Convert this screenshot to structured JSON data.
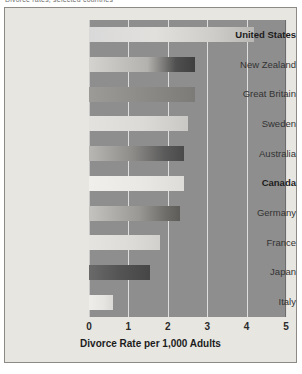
{
  "caption": {
    "clipped_text": "Divorce rates, selected countries"
  },
  "chart_data": {
    "type": "bar",
    "orientation": "horizontal",
    "title": "",
    "xlabel": "Divorce Rate per 1,000 Adults",
    "ylabel": "",
    "xlim": [
      0,
      5
    ],
    "xticks": [
      "0",
      "1",
      "2",
      "3",
      "4",
      "5"
    ],
    "grid": true,
    "legend": "none",
    "categories": [
      "United States",
      "New Zealand",
      "Great Britain",
      "Sweden",
      "Australia",
      "Canada",
      "Germany",
      "France",
      "Japan",
      "Italy"
    ],
    "values": [
      4.2,
      2.7,
      2.7,
      2.5,
      2.4,
      2.4,
      2.3,
      1.8,
      1.55,
      0.6
    ],
    "highlighted": [
      "United States",
      "Canada"
    ],
    "rows": [
      {
        "label": "United States",
        "value": 4.2,
        "bold": true,
        "style": "b0"
      },
      {
        "label": "New Zealand",
        "value": 2.7,
        "bold": false,
        "style": "b1"
      },
      {
        "label": "Great Britain",
        "value": 2.7,
        "bold": false,
        "style": "b2"
      },
      {
        "label": "Sweden",
        "value": 2.5,
        "bold": false,
        "style": "b3"
      },
      {
        "label": "Australia",
        "value": 2.4,
        "bold": false,
        "style": "b4"
      },
      {
        "label": "Canada",
        "value": 2.4,
        "bold": true,
        "style": "b6"
      },
      {
        "label": "Germany",
        "value": 2.3,
        "bold": false,
        "style": "b7"
      },
      {
        "label": "France",
        "value": 1.8,
        "bold": false,
        "style": "b8"
      },
      {
        "label": "Japan",
        "value": 1.55,
        "bold": false,
        "style": "b9"
      },
      {
        "label": "Italy",
        "value": 0.6,
        "bold": false,
        "style": "b10"
      }
    ]
  },
  "colors": {
    "figure_background": "#e8e6e1",
    "plot_background": "#8e8e8e",
    "gridline": "#dedede",
    "text": "#333333",
    "frame": "#8d8a85"
  }
}
